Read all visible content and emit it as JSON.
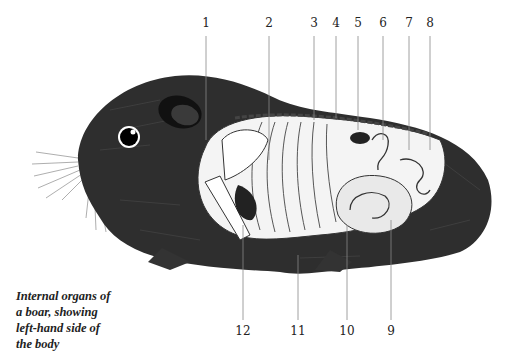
{
  "caption": {
    "line1": "Internal organs of",
    "line2": "a boar, showing",
    "line3": "left-hand side of",
    "line4": "the body"
  },
  "labels_top": [
    {
      "text": "1",
      "x": 206
    },
    {
      "text": "2",
      "x": 269
    },
    {
      "text": "3",
      "x": 314
    },
    {
      "text": "4",
      "x": 336
    },
    {
      "text": "5",
      "x": 358
    },
    {
      "text": "6",
      "x": 383
    },
    {
      "text": "7",
      "x": 409
    },
    {
      "text": "8",
      "x": 430
    }
  ],
  "labels_bottom": [
    {
      "text": "12",
      "x": 243
    },
    {
      "text": "11",
      "x": 298
    },
    {
      "text": "10",
      "x": 347
    },
    {
      "text": "9",
      "x": 391
    }
  ],
  "colors": {
    "fur": "#2a2a2a",
    "organs": "#f2f2f2",
    "line": "#888888",
    "text": "#222222"
  }
}
